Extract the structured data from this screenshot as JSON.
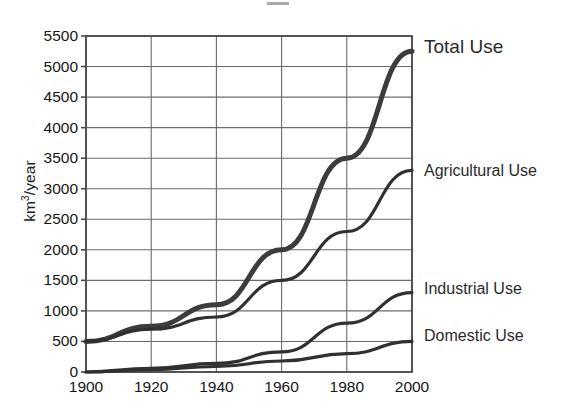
{
  "chart_data": {
    "type": "line",
    "title": "",
    "xlabel": "",
    "ylabel": "km3/year",
    "ylabel_parts": {
      "prefix": "km",
      "sup": "3",
      "suffix": "/year"
    },
    "x": [
      1900,
      1920,
      1940,
      1960,
      1980,
      2000
    ],
    "xlim": [
      1900,
      2000
    ],
    "ylim": [
      0,
      5500
    ],
    "xticks": [
      "1900",
      "1920",
      "1940",
      "1960",
      "1980",
      "2000"
    ],
    "yticks": [
      "0",
      "500",
      "1000",
      "1500",
      "2000",
      "2500",
      "3000",
      "3500",
      "4000",
      "4500",
      "5000",
      "5500"
    ],
    "ytick_values": [
      0,
      500,
      1000,
      1500,
      2000,
      2500,
      3000,
      3500,
      4000,
      4500,
      5000,
      5500
    ],
    "grid": true,
    "legend_position": "right-inline",
    "series": [
      {
        "name": "Total Use",
        "label": "Total Use",
        "values": [
          500,
          750,
          1100,
          2000,
          3500,
          5250
        ],
        "line_width": 5,
        "color": "#3c3c3c"
      },
      {
        "name": "Agricultural Use",
        "label": "Agricultural Use",
        "values": [
          500,
          700,
          900,
          1500,
          2300,
          3300
        ],
        "line_width": 3.2,
        "color": "#303030"
      },
      {
        "name": "Industrial Use",
        "label": "Industrial Use",
        "values": [
          0,
          60,
          140,
          330,
          800,
          1300
        ],
        "line_width": 3.2,
        "color": "#303030"
      },
      {
        "name": "Domestic Use",
        "label": "Domestic Use",
        "values": [
          0,
          40,
          90,
          180,
          300,
          500
        ],
        "line_width": 3.2,
        "color": "#303030"
      }
    ],
    "axis_color": "#4a4a4a",
    "grid_color": "#6a6a6a",
    "background": "#ffffff"
  }
}
